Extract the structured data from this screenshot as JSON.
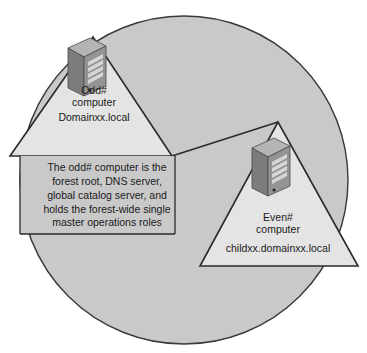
{
  "diagram": {
    "colors": {
      "background": "#ffffff",
      "forest_circle_fill": "#c9c9c9",
      "forest_circle_stroke": "#3a3a3a",
      "domain_triangle_fill": "#e4e4e4",
      "domain_triangle_stroke": "#2a2a2a",
      "server_front_fill": "#8f8f8f",
      "server_side_fill": "#6e6e6e",
      "server_top_fill": "#b4b4b4",
      "text": "#1a1a1a"
    },
    "forest": {
      "name": "forest-boundary-circle"
    },
    "root_domain": {
      "computer_label": "Odd#\ncomputer",
      "computer_label_line1": "Odd#",
      "computer_label_line2": "computer",
      "domain_name": "Domainxx.local",
      "note": "The odd# computer is the\nforest root, DNS server,\nglobal catalog server, and\nholds the forest-wide single\nmaster operations roles",
      "note_lines": [
        "The odd# computer is the",
        "forest root, DNS server,",
        "global catalog server, and",
        "holds the forest-wide single",
        "master operations roles"
      ]
    },
    "child_domain": {
      "computer_label": "Even#\ncomputer",
      "computer_label_line1": "Even#",
      "computer_label_line2": "computer",
      "domain_name": "childxx.domainxx.local"
    },
    "icons": {
      "root_server": "server-tower-icon",
      "child_server": "server-tower-icon",
      "trust_link": "trust-link-line"
    }
  }
}
